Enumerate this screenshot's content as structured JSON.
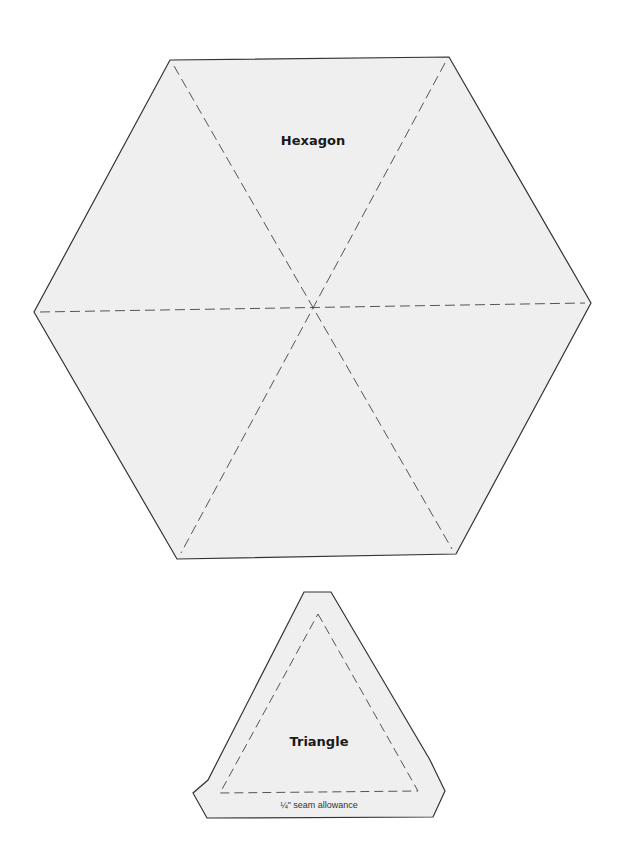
{
  "colors": {
    "background": "#ffffff",
    "fill": "#efefef",
    "outline": "#333333",
    "dash": "#555555"
  },
  "hexagon": {
    "label": "Hexagon",
    "points": "170,60 449,57 591,303 456,554 177,559 34,312",
    "center": [
      313,
      308
    ],
    "diagonals": [
      [
        174,
        66,
        452,
        549
      ],
      [
        445,
        63,
        181,
        553
      ],
      [
        40,
        312,
        585,
        303
      ]
    ]
  },
  "triangle": {
    "label": "Triangle",
    "seam_label": "¼\" seam allowance",
    "outer_points": "304,592 331,592 430,760 445,791 433,817 207,818 193,793 208,780",
    "inner_points": "318,614 418,791 220,793"
  }
}
